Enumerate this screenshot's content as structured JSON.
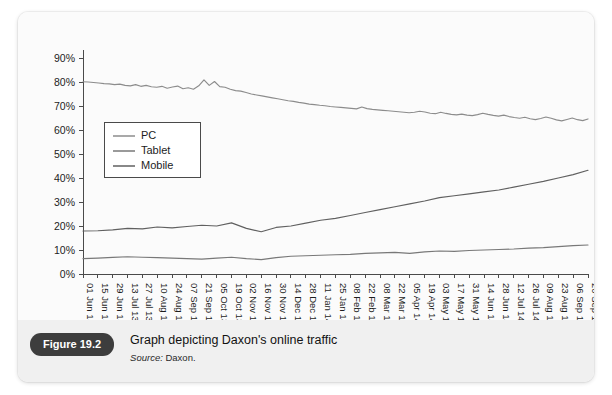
{
  "figure": {
    "badge_label": "Figure 19.2",
    "caption": "Graph depicting Daxon's online traffic",
    "source_label": "Source:",
    "source_value": "Daxon."
  },
  "chart_data": {
    "type": "line",
    "title": "",
    "xlabel": "",
    "ylabel": "",
    "ylim": [
      0,
      90
    ],
    "ytick_values": [
      0,
      10,
      20,
      30,
      40,
      50,
      60,
      70,
      80,
      90
    ],
    "ytick_labels": [
      "0%",
      "10%",
      "20%",
      "30%",
      "40%",
      "50%",
      "60%",
      "70%",
      "80%",
      "90%"
    ],
    "grid": false,
    "legend_position": "upper-left-inside",
    "categories": [
      "01 Jun 13",
      "15 Jun 13",
      "29 Jun 13",
      "13 Jul 13",
      "27 Jul 13",
      "10 Aug 13",
      "24 Aug 13",
      "07 Sep 13",
      "21 Sep 13",
      "05 Oct 13",
      "19 Oct 13",
      "02 Nov 13",
      "16 Nov 13",
      "30 Nov 13",
      "14 Dec 13",
      "28 Dec 13",
      "11 Jan 14",
      "25 Jan 14",
      "08 Feb 14",
      "22 Feb 14",
      "08 Mar 14",
      "22 Mar 14",
      "05 Apr 14",
      "19 Apr 14",
      "03 May 14",
      "17 May 14",
      "31 May 14",
      "14 Jun 14",
      "28 Jun 14",
      "12 Jul 14",
      "26 Jul 14",
      "09 Aug 14",
      "23 Aug 14",
      "06 Sep 14",
      "20 Sep 14"
    ],
    "series": [
      {
        "name": "PC",
        "color": "#8c8c8c",
        "values": [
          80.1,
          80.0,
          79.6,
          79.2,
          79.3,
          78.8,
          79.1,
          78.6,
          78.4,
          78.9,
          78.2,
          78.6,
          78.0,
          77.8,
          78.2,
          77.4,
          77.9,
          78.3,
          77.2,
          77.6,
          77.0,
          78.4,
          80.9,
          78.6,
          80.2,
          78.1,
          77.8,
          77.5,
          77.2,
          76.6,
          76.2,
          75.8,
          75.4,
          75.1,
          74.8
        ],
        "values_detail": [
          80.1,
          80.0,
          79.8,
          79.6,
          79.3,
          79.2,
          78.9,
          79.1,
          78.6,
          78.4,
          78.9,
          78.2,
          78.6,
          78.0,
          77.8,
          78.2,
          77.4,
          77.9,
          78.3,
          77.2,
          77.6,
          77.0,
          78.4,
          80.9,
          78.6,
          80.2,
          78.1,
          77.8,
          77.0,
          76.4,
          76.2,
          75.6,
          75.0,
          74.6,
          74.2,
          73.8,
          73.4,
          73.0,
          72.6,
          72.2,
          71.9,
          71.5,
          71.2,
          70.8,
          70.6,
          70.3,
          70.1,
          69.8,
          69.6,
          69.4,
          69.2,
          69.0,
          68.8,
          69.6,
          68.9,
          68.6,
          68.4,
          68.2,
          68.0,
          67.8,
          67.6,
          67.4,
          67.2,
          67.4,
          67.8,
          67.5,
          67.0,
          66.8,
          67.4,
          66.9,
          66.5,
          66.3,
          66.6,
          66.2,
          66.0,
          66.4,
          67.0,
          66.5,
          66.1,
          65.8,
          66.2,
          65.6,
          65.2,
          64.9,
          65.3,
          64.7,
          64.3,
          64.8,
          65.4,
          64.9,
          64.2,
          63.8,
          64.4,
          65.0,
          64.3,
          63.9,
          64.6
        ],
        "start_value": 80,
        "end_value": 64
      },
      {
        "name": "Tablet",
        "color": "#787878",
        "values": [
          6.4,
          6.6,
          6.9,
          7.2,
          7.0,
          6.8,
          6.6,
          6.4,
          6.2,
          6.6,
          7.0,
          6.4,
          6.0,
          6.8,
          7.4,
          7.6,
          7.8,
          8.0,
          8.2,
          8.6,
          8.8,
          9.0,
          8.6,
          9.2,
          9.6,
          9.4,
          9.8,
          10.0,
          10.2,
          10.4,
          10.8,
          11.0,
          11.4,
          11.8,
          12.1
        ],
        "start_value": 6,
        "end_value": 12
      },
      {
        "name": "Mobile",
        "color": "#606060",
        "values": [
          17.9,
          18.0,
          18.4,
          19.0,
          18.8,
          19.6,
          19.2,
          19.8,
          20.3,
          20.0,
          21.3,
          19.0,
          17.6,
          19.4,
          20.0,
          21.2,
          22.4,
          23.2,
          24.4,
          25.6,
          26.8,
          28.0,
          29.2,
          30.4,
          31.8,
          32.6,
          33.4,
          34.2,
          35.0,
          36.2,
          37.4,
          38.6,
          40.0,
          41.4,
          43.2
        ],
        "start_value": 18,
        "end_value": 43
      }
    ]
  }
}
